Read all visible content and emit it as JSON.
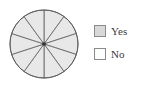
{
  "figure": {
    "background_color": "#ffffff",
    "width": 141,
    "height": 90
  },
  "chart_data": {
    "type": "pie",
    "title": "",
    "subtitle": "",
    "xlabel": "",
    "ylabel": "",
    "categories": [
      "Slice 1",
      "Slice 2",
      "Slice 3",
      "Slice 4",
      "Slice 5",
      "Slice 6",
      "Slice 7",
      "Slice 8",
      "Slice 9",
      "Slice 10"
    ],
    "values": [
      10,
      10,
      10,
      10,
      10,
      10,
      10,
      10,
      10,
      10
    ],
    "slice_count": 10,
    "slice_angle_degrees": 36,
    "start_angle_degrees": 0,
    "equal_slices": true,
    "slice_fill_color": "#e8e8e8",
    "slice_stroke_color": "#6b6b6b",
    "outline_color": "#5f5f5f",
    "center_marker_color": "#333333",
    "center_x": 44,
    "center_y": 44,
    "radius": 34,
    "grid": false,
    "legend_position": "right",
    "legend_entries": [
      {
        "label": "Yes",
        "swatch_fill": "#d8d8d8",
        "swatch_border": "#8a8a8a"
      },
      {
        "label": "No",
        "swatch_fill": "#fdfdfd",
        "swatch_border": "#8a8a8a"
      }
    ],
    "annotations": []
  }
}
